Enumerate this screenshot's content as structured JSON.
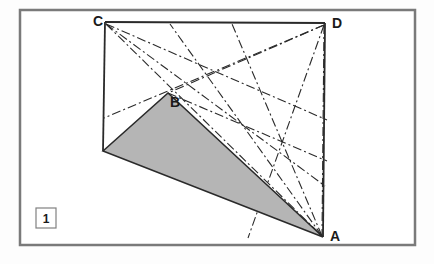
{
  "figure": {
    "index_label": "1",
    "caption": "",
    "frame": {
      "x": 20,
      "y": 10,
      "width": 395,
      "height": 235,
      "stroke_color": "#7a7a7a",
      "stroke_width": 2.5,
      "fill_color": "#ffffff"
    },
    "background_color": "#fdfdfd",
    "index_box": {
      "x": 36,
      "y": 208,
      "width": 20,
      "height": 20,
      "stroke_color": "#808080",
      "fill_color": "#ffffff"
    },
    "vertices": [
      {
        "name": "C",
        "x": 105,
        "y": 22,
        "label": "C",
        "label_x": 93,
        "label_y": 26
      },
      {
        "name": "D",
        "x": 325,
        "y": 23,
        "label": "D",
        "label_x": 332,
        "label_y": 28
      },
      {
        "name": "A",
        "x": 323,
        "y": 237,
        "label": "A",
        "label_x": 330,
        "label_y": 241
      },
      {
        "name": "B",
        "x": 168,
        "y": 93,
        "label": "B",
        "label_x": 170,
        "label_y": 107
      },
      {
        "name": "E",
        "x": 103,
        "y": 151,
        "label": "",
        "label_x": 0,
        "label_y": 0
      }
    ],
    "shaded_triangle": {
      "points": "103,151 168,93 323,237",
      "fill_color": "#b5b5b5",
      "stroke_color": "#2a2a2a",
      "stroke_width": 1.6
    },
    "solid_edges": [
      {
        "name": "edge-CD",
        "x1": 105,
        "y1": 22,
        "x2": 325,
        "y2": 23
      },
      {
        "name": "edge-DA",
        "x1": 325,
        "y1": 23,
        "x2": 323,
        "y2": 237
      },
      {
        "name": "edge-C-left",
        "x1": 105,
        "y1": 22,
        "x2": 103,
        "y2": 151
      }
    ],
    "dashdot_lines": [
      {
        "name": "line-C-to-A",
        "x1": 106,
        "y1": 24,
        "x2": 322,
        "y2": 236
      },
      {
        "name": "line-C-to-lowerright",
        "x1": 106,
        "y1": 24,
        "x2": 325,
        "y2": 186
      },
      {
        "name": "line-C-to-midright",
        "x1": 106,
        "y1": 24,
        "x2": 327,
        "y2": 120
      },
      {
        "name": "line-D-to-leftlow",
        "x1": 324,
        "y1": 25,
        "x2": 104,
        "y2": 118
      },
      {
        "name": "line-D-to-B",
        "x1": 324,
        "y1": 25,
        "x2": 168,
        "y2": 93
      },
      {
        "name": "line-D-to-A",
        "x1": 324,
        "y1": 25,
        "x2": 322,
        "y2": 236
      },
      {
        "name": "line-D-to-lowerleft",
        "x1": 324,
        "y1": 25,
        "x2": 248,
        "y2": 238
      },
      {
        "name": "line-A-to-C-upper",
        "x1": 322,
        "y1": 236,
        "x2": 170,
        "y2": 24
      },
      {
        "name": "line-A-to-topmid",
        "x1": 322,
        "y1": 236,
        "x2": 232,
        "y2": 24
      },
      {
        "name": "line-B-to-D-ext",
        "x1": 168,
        "y1": 93,
        "x2": 327,
        "y2": 161
      }
    ],
    "dashdot_style": {
      "stroke_color": "#2a2a2a",
      "stroke_width": 1.1,
      "dash_pattern": "9 3 2 3"
    }
  }
}
